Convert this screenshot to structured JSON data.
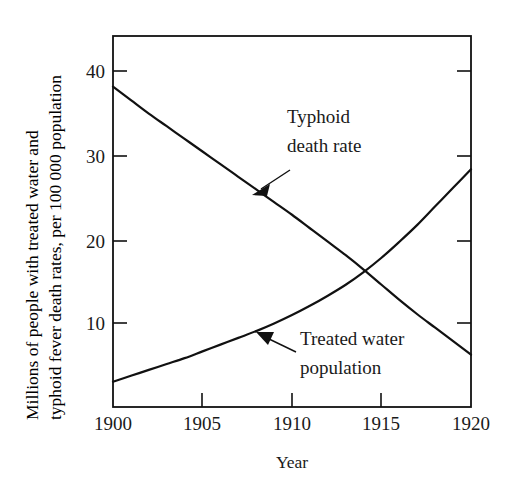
{
  "chart_data": {
    "type": "line",
    "title": "",
    "xlabel": "Year",
    "ylabel_line1": "Millions of people with treated water and",
    "ylabel_line2": "typhoid fever death rates, per 100 000 population",
    "xlim": [
      1900,
      1920
    ],
    "ylim": [
      0,
      44
    ],
    "grid": false,
    "legend": "annotations on plot",
    "x_ticks": [
      "1900",
      "1905",
      "1910",
      "1915",
      "1920"
    ],
    "x_tick_values": [
      1900,
      1905,
      1910,
      1915,
      1920
    ],
    "y_ticks": [
      "10",
      "20",
      "30",
      "40"
    ],
    "y_tick_values": [
      10,
      20,
      30,
      40
    ],
    "x": [
      1900,
      1901,
      1902,
      1903,
      1904,
      1905,
      1906,
      1907,
      1908,
      1909,
      1910,
      1911,
      1912,
      1913,
      1914,
      1915,
      1916,
      1917,
      1918,
      1919,
      1920
    ],
    "series": [
      {
        "name": "Typhoid death rate",
        "units": "deaths per 100 000 population",
        "values": [
          38.0,
          36.4,
          34.8,
          33.3,
          31.8,
          30.3,
          28.8,
          27.3,
          25.8,
          24.3,
          22.8,
          21.2,
          19.6,
          18.0,
          16.3,
          14.5,
          12.7,
          11.0,
          9.4,
          7.8,
          6.2
        ]
      },
      {
        "name": "Treated water population",
        "units": "millions of people",
        "values": [
          3.0,
          3.7,
          4.4,
          5.1,
          5.8,
          6.6,
          7.4,
          8.2,
          9.0,
          9.9,
          10.9,
          12.0,
          13.2,
          14.5,
          16.0,
          17.7,
          19.6,
          21.6,
          23.8,
          26.0,
          28.2
        ]
      }
    ],
    "crossing_point": {
      "x": 1913,
      "y": 16.3
    },
    "annotations": [
      {
        "id": "typhoid",
        "text_line1": "Typhoid",
        "text_line2": "death rate",
        "points_to_series": "Typhoid death rate",
        "points_to_x": 1907.5,
        "points_to_y": 26.3
      },
      {
        "id": "treated-water",
        "text_line1": "Treated water",
        "text_line2": "population",
        "points_to_series": "Treated water population",
        "points_to_x": 1907.5,
        "points_to_y": 8.9
      }
    ],
    "colors": {
      "line": "#111111",
      "axis": "#111111",
      "text": "#1a1a1a",
      "background": "#ffffff"
    }
  }
}
